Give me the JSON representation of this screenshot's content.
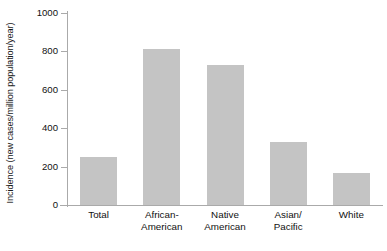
{
  "chart_data": {
    "type": "bar",
    "title": "",
    "subtitle": "",
    "xlabel": "",
    "ylabel": "Incidence (new cases/million population/year)",
    "categories": [
      "Total",
      "African-American",
      "Native American",
      "Asian/Pacific",
      "White"
    ],
    "category_lines": [
      [
        "Total"
      ],
      [
        "African-",
        "American"
      ],
      [
        "Native",
        "American"
      ],
      [
        "Asian/",
        "Pacific"
      ],
      [
        "White"
      ]
    ],
    "values": [
      250,
      815,
      730,
      330,
      165
    ],
    "ylim": [
      0,
      1000
    ],
    "yticks": [
      0,
      200,
      400,
      600,
      800,
      1000
    ],
    "ytick_labels": [
      "0",
      "200",
      "400",
      "600",
      "800",
      "1000"
    ],
    "grid": false,
    "legend": null,
    "bar_color": "#c4c4c4",
    "axis_color": "#aaaaaa",
    "text_color": "#111111",
    "background": "#ffffff"
  }
}
